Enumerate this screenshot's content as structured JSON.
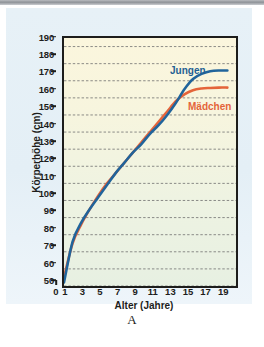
{
  "figure": {
    "caption": "A",
    "background_panel_color": "#e7f1f7",
    "plot_background_top": "#fbf6dd",
    "plot_background_bottom": "#e7f0e2"
  },
  "chart_data": {
    "type": "line",
    "title": "",
    "xlabel": "Alter (Jahre)",
    "ylabel": "Körperhöhe (cm)",
    "xlim": [
      0,
      20
    ],
    "ylim": [
      50,
      195
    ],
    "grid": true,
    "grid_style": "dashed-horizontal",
    "legend_position": "inline-annotation",
    "xticks": [
      0,
      1,
      3,
      5,
      7,
      9,
      11,
      13,
      15,
      17,
      19
    ],
    "xtick_labels": [
      "0",
      "1",
      "3",
      "5",
      "7",
      "9",
      "11",
      "13",
      "15",
      "17",
      "19"
    ],
    "yticks": [
      50,
      60,
      70,
      80,
      90,
      100,
      110,
      120,
      130,
      140,
      150,
      160,
      170,
      180,
      190
    ],
    "ytick_labels": [
      "50",
      "60",
      "70",
      "80",
      "90",
      "100",
      "110",
      "120",
      "130",
      "140",
      "150",
      "160",
      "170",
      "180",
      "190"
    ],
    "x": [
      0,
      1,
      2,
      3,
      4,
      5,
      6,
      7,
      8,
      9,
      10,
      11,
      12,
      13,
      14,
      15,
      16,
      17,
      18,
      19
    ],
    "series": [
      {
        "name": "Jungen",
        "color": "#20649b",
        "values": [
          52,
          76,
          87,
          95,
          102,
          109,
          116,
          122,
          128,
          133,
          139,
          144,
          150,
          157,
          165,
          171,
          174,
          175.5,
          176,
          176
        ]
      },
      {
        "name": "Mädchen",
        "color": "#e4643a",
        "values": [
          55,
          75,
          86,
          95,
          103,
          110,
          116,
          122,
          128,
          134,
          140,
          146,
          152,
          158,
          162,
          164.5,
          165.5,
          165.8,
          166,
          166
        ]
      }
    ],
    "annotations": [
      {
        "text": "Jungen",
        "color": "#1f5f93"
      },
      {
        "text": "Mädchen",
        "color": "#e4643a"
      }
    ]
  }
}
